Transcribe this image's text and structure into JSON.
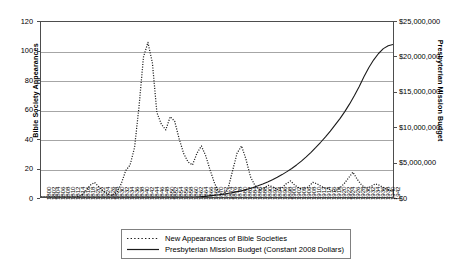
{
  "chart_data": {
    "type": "line",
    "title": "",
    "xlabel": "",
    "grid": "horizontal",
    "legend_position": "bottom",
    "axes": {
      "y_left": {
        "label": "Bible Society Appearances",
        "ticks": [
          "0",
          "20",
          "40",
          "60",
          "80",
          "100",
          "120"
        ],
        "ylim": [
          0,
          120
        ],
        "step": 20
      },
      "y_right": {
        "label": "Presbyterian Mission Budget",
        "ticks": [
          "$0",
          "$5,000,000",
          "$10,000,000",
          "$15,000,000",
          "$20,000,000",
          "$25,000,000"
        ],
        "ylim": [
          0,
          25000000
        ],
        "step": 5000000
      },
      "x": {
        "label": "",
        "tick_labels": [
          "1800",
          "1802",
          "1804",
          "1806",
          "1808",
          "1810",
          "1812",
          "1814",
          "1816",
          "1818",
          "1820",
          "1822",
          "1824",
          "1826",
          "1828",
          "1830",
          "1832",
          "1834",
          "1836",
          "1838",
          "1840",
          "1842",
          "1844",
          "1846",
          "1848",
          "1850",
          "1852",
          "1854",
          "1856",
          "1858",
          "1860",
          "1862",
          "1864",
          "1866",
          "1868",
          "1870",
          "1872",
          "1874",
          "1876",
          "1878",
          "1880",
          "1882",
          "1884",
          "1886",
          "1888",
          "1890",
          "1892",
          "1894",
          "1896",
          "1898",
          "1900",
          "1902",
          "1904",
          "1906",
          "1908",
          "1910",
          "1912",
          "1914",
          "1916",
          "1918",
          "1920",
          "1922",
          "1924",
          "1926",
          "1928",
          "1930",
          "1932",
          "1934",
          "1936",
          "1938",
          "1940",
          "1942"
        ]
      }
    },
    "series": [
      {
        "name": "New Appearances of Bible Societies",
        "style": "dotted",
        "color": "#1a1a1a",
        "axis": "y_left",
        "values": [
          0,
          0,
          0,
          0,
          0,
          0,
          0,
          0,
          0,
          1,
          4,
          8,
          10,
          7,
          4,
          2,
          1,
          3,
          9,
          18,
          22,
          34,
          62,
          96,
          106,
          92,
          58,
          50,
          46,
          55,
          52,
          40,
          30,
          24,
          22,
          30,
          35,
          28,
          18,
          9,
          3,
          2,
          6,
          18,
          30,
          35,
          26,
          14,
          8,
          5,
          6,
          8,
          7,
          5,
          6,
          9,
          11,
          8,
          6,
          5,
          7,
          10,
          9,
          7,
          6,
          5,
          4,
          6,
          9,
          13,
          17,
          12,
          8,
          6,
          7,
          9,
          8,
          6,
          5,
          4
        ]
      },
      {
        "name": "Presbyterian Mission Budget (Constant 2008 Dollars)",
        "style": "solid",
        "color": "#1a1a1a",
        "axis": "y_right",
        "values": [
          0,
          0,
          0,
          0,
          0,
          0,
          0,
          0,
          0,
          0,
          0,
          0,
          0,
          0,
          0,
          0,
          0,
          0,
          0,
          0,
          0,
          0,
          0,
          0,
          0,
          0,
          0,
          0,
          0,
          0,
          0,
          0,
          0,
          40000,
          90000,
          160000,
          240000,
          330000,
          430000,
          540000,
          660000,
          800000,
          960000,
          1150000,
          1360000,
          1600000,
          1860000,
          2150000,
          2470000,
          2820000,
          3200000,
          3620000,
          4080000,
          4580000,
          5120000,
          5720000,
          6380000,
          7080000,
          7820000,
          8600000,
          9420000,
          10300000,
          11200000,
          12200000,
          13300000,
          14500000,
          15800000,
          17200000,
          18500000,
          19600000,
          20500000,
          21200000,
          21600000,
          21800000
        ]
      }
    ]
  },
  "legend": {
    "entries": [
      {
        "label": "New Appearances of Bible Societies",
        "style": "dotted"
      },
      {
        "label": "Presbyterian Mission Budget (Constant 2008 Dollars)",
        "style": "solid"
      }
    ]
  }
}
